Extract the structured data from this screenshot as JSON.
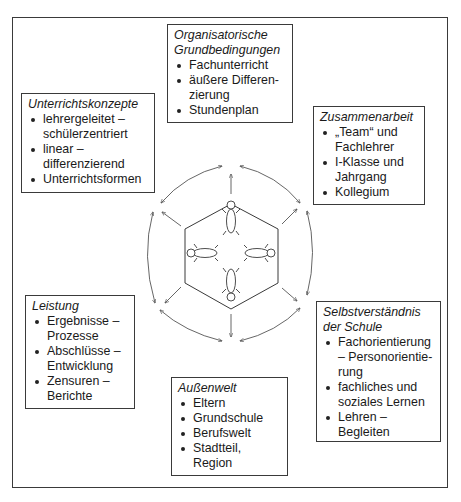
{
  "diagram": {
    "boxes": {
      "top": {
        "title": "Organisatorische Grundbedingungen",
        "items": [
          "Fachunterricht",
          "äußere Differen-zierung",
          "Stundenplan"
        ]
      },
      "upper_left": {
        "title": "Unterrichtskonzepte",
        "items": [
          "lehrergeleitet – schülerzentriert",
          "linear – differenzierend",
          "Unterrichtsformen"
        ]
      },
      "upper_right": {
        "title": "Zusammenarbeit",
        "items": [
          "„Team“ und Fachlehrer",
          "I-Klasse und Jahrgang",
          "Kollegium"
        ]
      },
      "lower_left": {
        "title": "Leistung",
        "items": [
          "Ergebnisse – Prozesse",
          "Abschlüsse – Entwicklung",
          "Zensuren – Berichte"
        ]
      },
      "lower_right": {
        "title": "Selbstverständnis der Schule",
        "items": [
          "Fachorientierung – Personorientie-rung",
          "fachliches und soziales Lernen",
          "Lehren – Begleiten"
        ]
      },
      "bottom": {
        "title": "Außenwelt",
        "items": [
          "Eltern",
          "Grundschule",
          "Berufswelt",
          "Stadtteil, Region"
        ]
      }
    },
    "center": {
      "shape": "hexagon",
      "figures": 4,
      "description": "four stylized persons around a table"
    },
    "colors": {
      "line": "#3a3a3a",
      "arrow": "#555555",
      "background": "#ffffff"
    }
  }
}
